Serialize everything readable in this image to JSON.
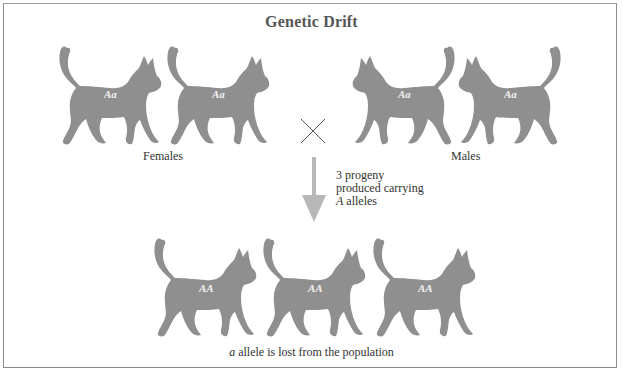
{
  "figure": {
    "title": "Genetic Drift",
    "colors": {
      "cat_fill": "#8f8f8f",
      "arrow_fill": "#b8b8b8",
      "frame_border": "#8a8a8a",
      "text": "#333333"
    },
    "parents": {
      "females": {
        "label": "Females",
        "cats": [
          {
            "genotype": "Aa"
          },
          {
            "genotype": "Aa"
          }
        ]
      },
      "males": {
        "label": "Males",
        "cats": [
          {
            "genotype": "Aa"
          },
          {
            "genotype": "Aa"
          }
        ]
      },
      "cross_symbol": "×"
    },
    "arrow_note": {
      "line1": "3 progeny",
      "line2": "produced carrying",
      "line3_italic": "A",
      "line3_rest": " alleles"
    },
    "progeny": {
      "cats": [
        {
          "genotype": "AA"
        },
        {
          "genotype": "AA"
        },
        {
          "genotype": "AA"
        }
      ],
      "caption_italic": "a",
      "caption_rest": " allele is lost from the population"
    }
  }
}
